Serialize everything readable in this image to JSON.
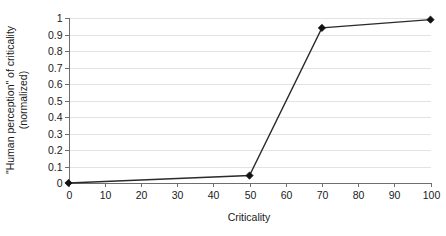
{
  "chart_data": {
    "type": "line",
    "title": "",
    "subtitle": "",
    "xlabel": "Criticality",
    "ylabel": "\"Human perception\" of criticality (normalized)",
    "ylabel_line1": "\"Human perception\" of criticality",
    "ylabel_line2": "(normalized)",
    "xlim": [
      0,
      100
    ],
    "ylim": [
      0,
      1
    ],
    "grid": "horizontal",
    "legend": "none",
    "x": [
      0,
      50,
      70,
      100
    ],
    "series": [
      {
        "name": "perception",
        "values": [
          0,
          0.045,
          0.94,
          0.99
        ],
        "marker": "diamond",
        "color": "#2b2b2b"
      }
    ],
    "xticks": [
      0,
      10,
      20,
      30,
      40,
      50,
      60,
      70,
      80,
      90,
      100
    ],
    "xtick_labels": [
      "0",
      "10",
      "20",
      "30",
      "40",
      "50",
      "60",
      "70",
      "80",
      "90",
      "100"
    ],
    "yticks": [
      0,
      0.1,
      0.2,
      0.3,
      0.4,
      0.5,
      0.6,
      0.7,
      0.8,
      0.9,
      1
    ],
    "ytick_labels": [
      "0",
      "0.1",
      "0.2",
      "0.3",
      "0.4",
      "0.5",
      "0.6",
      "0.7",
      "0.8",
      "0.9",
      "1"
    ]
  },
  "colors": {
    "background": "#ffffff",
    "gridline": "#e3e3e3",
    "axis": "#6e6e6e",
    "series": "#2b2b2b",
    "marker": "#111111",
    "text": "#1a1a1a"
  }
}
